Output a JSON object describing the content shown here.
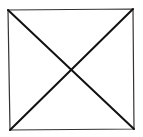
{
  "diagram": {
    "type": "square-with-diagonals",
    "background": "#ffffff",
    "square": {
      "corners": {
        "top_left": [
          8,
          10
        ],
        "top_right": [
          133,
          9
        ],
        "bottom_right": [
          134,
          129
        ],
        "bottom_left": [
          10,
          130
        ]
      },
      "stroke": "#333333",
      "stroke_width": 1.2
    },
    "diagonals": [
      {
        "from": [
          8,
          10
        ],
        "to": [
          134,
          129
        ],
        "stroke": "#111111",
        "stroke_width": 2
      },
      {
        "from": [
          133,
          9
        ],
        "to": [
          10,
          130
        ],
        "stroke": "#111111",
        "stroke_width": 2
      }
    ],
    "intersection": [
      70,
      70
    ]
  }
}
